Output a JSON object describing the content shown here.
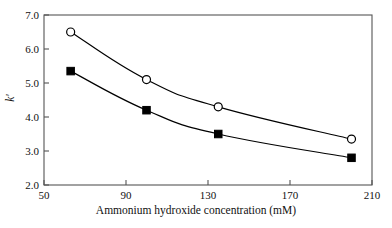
{
  "chart_data": {
    "type": "line",
    "title": "",
    "subtitle": "",
    "xlabel": "Ammonium hydroxide concentration (mM)",
    "ylabel": "k'",
    "xlim": [
      50,
      210
    ],
    "ylim": [
      2.0,
      7.0
    ],
    "xticks": [
      50,
      90,
      130,
      170,
      210
    ],
    "xtick_labels": [
      "50",
      "90",
      "130",
      "170",
      "210"
    ],
    "yticks": [
      2.0,
      3.0,
      4.0,
      5.0,
      6.0,
      7.0
    ],
    "ytick_labels": [
      "2.0",
      "3.0",
      "4.0",
      "5.0",
      "6.0",
      "7.0"
    ],
    "grid": false,
    "legend": false,
    "legend_position": "none",
    "x": [
      63,
      100,
      135,
      200
    ],
    "series": [
      {
        "name": "open-circle-series",
        "marker": "open-circle",
        "color": "#000000",
        "values": [
          6.5,
          5.1,
          4.3,
          3.35
        ]
      },
      {
        "name": "filled-square-series",
        "marker": "filled-square",
        "color": "#000000",
        "values": [
          5.35,
          4.2,
          3.5,
          2.8
        ]
      }
    ],
    "annotations": []
  },
  "style": {
    "axis_color": "#555555",
    "line_color": "#1a1a1a",
    "background": "#ffffff"
  }
}
